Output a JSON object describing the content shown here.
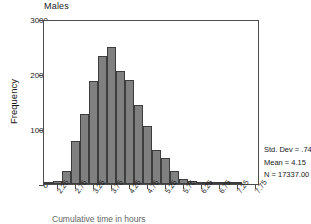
{
  "chart_data": {
    "type": "bar",
    "title": "Males",
    "xlabel": "Cumulative time in hours",
    "ylabel": "Frequency",
    "ylim": [
      0,
      3000
    ],
    "ytick_labels": [
      "0",
      "1000",
      "2000",
      "3000"
    ],
    "ytick_values": [
      0,
      1000,
      2000,
      3000
    ],
    "xlim": [
      1.875,
      7.875
    ],
    "xtick_labels": [
      "2.25",
      "2.75",
      "3.25",
      "3.75",
      "4.25",
      "4.75",
      "5.25",
      "5.75",
      "6.25",
      "6.75",
      "7.25",
      "7.75"
    ],
    "xtick_values": [
      2.25,
      2.75,
      3.25,
      3.75,
      4.25,
      4.75,
      5.25,
      5.75,
      6.25,
      6.75,
      7.25,
      7.75
    ],
    "bin_width": 0.25,
    "grid": false,
    "legend": "none",
    "categories": [
      "2.00",
      "2.25",
      "2.50",
      "2.75",
      "3.00",
      "3.25",
      "3.50",
      "3.75",
      "4.00",
      "4.25",
      "4.50",
      "4.75",
      "5.00",
      "5.25",
      "5.50",
      "5.75",
      "6.00",
      "6.25",
      "6.50",
      "6.75",
      "7.00",
      "7.25"
    ],
    "values": [
      30,
      60,
      230,
      790,
      1280,
      1870,
      2330,
      2500,
      2060,
      1890,
      1430,
      1050,
      610,
      470,
      235,
      95,
      55,
      30,
      20,
      15,
      8,
      5
    ],
    "bar_color": "#808080",
    "bar_edge_color": "#3d3d3d"
  },
  "stats": {
    "std_dev": "Std. Dev = .74",
    "mean": "Mean = 4.15",
    "n": "N = 17337.00"
  }
}
